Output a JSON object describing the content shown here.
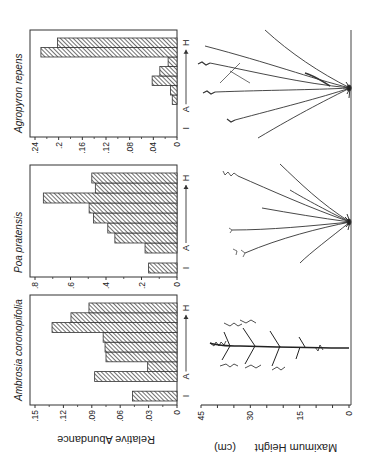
{
  "figure": {
    "top_ylabel": "Relative Abundance",
    "bottom_ylabel": "Maximum Height",
    "bottom_ylabel_unit": "(cm)",
    "category_labels": {
      "start": "I",
      "mid": "A",
      "end": "H"
    },
    "height_axis": {
      "ticks": [
        "45",
        "30",
        "15",
        "0"
      ],
      "min": 0,
      "max": 45
    }
  },
  "chart_data": [
    {
      "type": "bar",
      "title": "Ambrosia coronopifolia",
      "xlabel": "I  A → H",
      "ylabel": "Relative Abundance",
      "ylim": [
        0,
        0.15
      ],
      "yticks": [
        ".15",
        ".12",
        ".09",
        ".06",
        ".03",
        "0"
      ],
      "positions": [
        1,
        3,
        4,
        5,
        6,
        7,
        8,
        9,
        10
      ],
      "values": [
        0.047,
        0.087,
        0.031,
        0.075,
        0.076,
        0.078,
        0.132,
        0.112,
        0.093
      ]
    },
    {
      "type": "bar",
      "title": "Poa pratensis",
      "xlabel": "I  A → H",
      "ylabel": "Relative Abundance",
      "ylim": [
        0,
        0.8
      ],
      "yticks": [
        ".8",
        ".6",
        ".4",
        ".2",
        "0"
      ],
      "positions": [
        1,
        3,
        4,
        5,
        6,
        7,
        8,
        9,
        10
      ],
      "values": [
        0.16,
        0.18,
        0.35,
        0.39,
        0.47,
        0.495,
        0.753,
        0.46,
        0.48
      ]
    },
    {
      "type": "bar",
      "title": "Agropyron repens",
      "xlabel": "I  A → H",
      "ylabel": "Relative Abundance",
      "ylim": [
        0,
        0.24
      ],
      "yticks": [
        ".24",
        ".2",
        ".16",
        ".12",
        ".08",
        ".04",
        "0"
      ],
      "positions": [
        4,
        5,
        6,
        7,
        8,
        9,
        10
      ],
      "values": [
        0.008,
        0.011,
        0.042,
        0.029,
        0.015,
        0.23,
        0.202
      ]
    }
  ]
}
